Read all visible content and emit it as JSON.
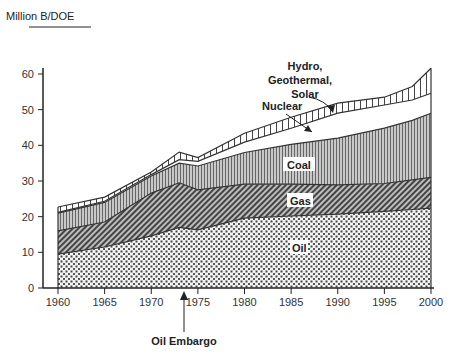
{
  "chart_data": {
    "type": "area",
    "stacked": true,
    "title": "",
    "xlabel": "",
    "ylabel": "Million B/DOE",
    "xlim": [
      1960,
      2000
    ],
    "ylim": [
      0,
      60
    ],
    "x_ticks": [
      "1960",
      "1965",
      "1970",
      "1975",
      "1980",
      "1985",
      "1990",
      "1995",
      "2000"
    ],
    "y_ticks": [
      "0",
      "10",
      "20",
      "30",
      "40",
      "50",
      "60"
    ],
    "grid": false,
    "legend": "inline labels",
    "x": [
      1960,
      1965,
      1970,
      1973,
      1975,
      1980,
      1985,
      1990,
      1995,
      1998,
      2000
    ],
    "series": [
      {
        "name": "Oil",
        "pattern": "dots",
        "values": [
          9.5,
          11.5,
          14.6,
          17.0,
          16.3,
          19.6,
          20.2,
          20.7,
          21.5,
          22.0,
          22.4
        ]
      },
      {
        "name": "Gas",
        "pattern": "diagonal-hatch",
        "values": [
          6.5,
          7.0,
          12.0,
          12.5,
          11.2,
          9.5,
          8.9,
          8.2,
          7.8,
          8.3,
          8.6
        ]
      },
      {
        "name": "Coal",
        "pattern": "vertical-lines",
        "values": [
          5.0,
          5.5,
          4.8,
          5.5,
          6.7,
          8.9,
          11.2,
          13.1,
          15.5,
          16.7,
          18.0
        ]
      },
      {
        "name": "Nuclear",
        "pattern": "white",
        "values": [
          0.2,
          0.3,
          0.4,
          1.0,
          1.3,
          2.9,
          4.5,
          7.0,
          6.5,
          5.7,
          5.6
        ]
      },
      {
        "name": "Hydro, Geothermal, Solar",
        "pattern": "sparse-vertical-lines",
        "values": [
          1.5,
          1.2,
          0.7,
          2.1,
          1.1,
          2.5,
          3.1,
          2.8,
          2.2,
          3.8,
          7.0
        ]
      }
    ],
    "annotations": [
      {
        "text": "Oil Embargo",
        "x": 1973,
        "type": "arrow-up-to-axis"
      },
      {
        "text": "Nuclear",
        "type": "arrow-label"
      },
      {
        "text": "Hydro, Geothermal, Solar",
        "type": "arrow-label"
      }
    ]
  },
  "labels": {
    "ylabel": "Million B/DOE",
    "oil": "Oil",
    "gas": "Gas",
    "coal": "Coal",
    "nuclear": "Nuclear",
    "hydro_line1": "Hydro,",
    "hydro_line2": "Geothermal,",
    "hydro_line3": "Solar",
    "embargo": "Oil Embargo"
  },
  "colors": {
    "ink": "#333333",
    "coal_fill": "#bdbdbd",
    "background": "#ffffff"
  }
}
